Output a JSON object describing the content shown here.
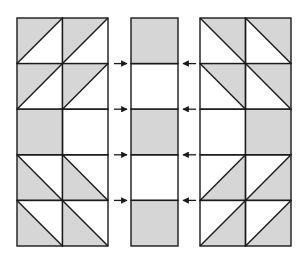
{
  "colors": {
    "shade": "#d6d6d6",
    "line": "#1a1a1a",
    "background": "#ffffff"
  },
  "panels": {
    "left": {
      "x": 17,
      "y": 18,
      "cell_w": 45.5,
      "cell_h": 45.6,
      "cols": 2,
      "rows": [
        [
          "tri-ul",
          "tri-ul"
        ],
        [
          "tri-ul",
          "tri-ul"
        ],
        [
          "full",
          "empty"
        ],
        [
          "tri-ll",
          "tri-ll"
        ],
        [
          "tri-ll",
          "tri-ll"
        ]
      ]
    },
    "middle": {
      "x": 131,
      "y": 18,
      "cell_w": 47,
      "cell_h": 45.6,
      "cols": 1,
      "rows": [
        [
          "full"
        ],
        [
          "empty"
        ],
        [
          "full"
        ],
        [
          "empty"
        ],
        [
          "full"
        ]
      ]
    },
    "right": {
      "x": 200,
      "y": 18,
      "cell_w": 45.5,
      "cell_h": 45.6,
      "cols": 2,
      "rows": [
        [
          "tri-ur",
          "tri-ur"
        ],
        [
          "tri-ur",
          "tri-ur"
        ],
        [
          "empty",
          "full"
        ],
        [
          "tri-lr",
          "tri-lr"
        ],
        [
          "tri-lr",
          "tri-lr"
        ]
      ]
    }
  },
  "arrows": {
    "from_left": {
      "x1": 114,
      "x2": 127,
      "ys": [
        63.6,
        109.2,
        154.8,
        200.4
      ],
      "direction": "right"
    },
    "from_right": {
      "x1": 196,
      "x2": 183,
      "ys": [
        63.6,
        109.2,
        154.8,
        200.4
      ],
      "direction": "left"
    }
  }
}
